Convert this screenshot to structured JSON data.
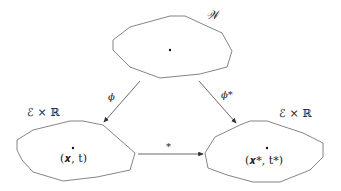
{
  "diagram": {
    "nodes": [
      {
        "id": "W",
        "label": "𝒲"
      },
      {
        "id": "ExR_left",
        "label": "ℰ × ℝ",
        "point_label": "(x, t)"
      },
      {
        "id": "ExR_right",
        "label": "ℰ × ℝ",
        "point_label": "(x*, t*)"
      }
    ],
    "edges": [
      {
        "from": "W",
        "to": "ExR_left",
        "label": "ϕ"
      },
      {
        "from": "W",
        "to": "ExR_right",
        "label": "ϕ*"
      },
      {
        "from": "ExR_left",
        "to": "ExR_right",
        "label": "*"
      }
    ],
    "labels": {
      "top_set": "𝒲",
      "left_set": "ℰ × ℝ",
      "right_set": "ℰ × ℝ",
      "left_point": "(𝒙, t)",
      "right_point": "(𝒙*, t*)",
      "phi": "ϕ",
      "phi_star": "ϕ*",
      "star": "*"
    },
    "colors": {
      "stroke": "#555555",
      "text": "#222222"
    }
  }
}
